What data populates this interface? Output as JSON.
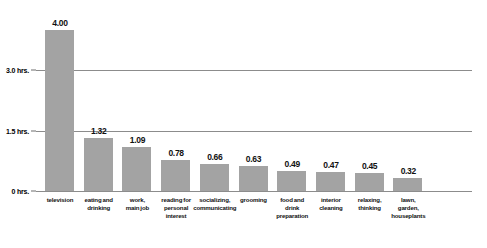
{
  "chart_data": {
    "type": "bar",
    "title": "",
    "subtitle": "",
    "xlabel": "",
    "ylabel": "",
    "ylim": [
      0,
      4.4
    ],
    "grid": true,
    "legend": null,
    "orientation": "vertical",
    "bar_color": "#a3a3a3",
    "gridline_color": "#8c8c8c",
    "value_label_format": "2dp",
    "y_ticks": [
      {
        "value": 0,
        "label": "0 hrs."
      },
      {
        "value": 1.5,
        "label": "1.5 hrs."
      },
      {
        "value": 3.0,
        "label": "3.0 hrs."
      }
    ],
    "categories": [
      "television",
      "eating and drinking",
      "work, main job",
      "reading for personal interest",
      "socializing, communicating",
      "grooming",
      "food and drink preparation",
      "interior cleaning",
      "relaxing, thinking",
      "lawn, garden, houseplants"
    ],
    "values": [
      4.0,
      1.32,
      1.09,
      0.78,
      0.66,
      0.63,
      0.49,
      0.47,
      0.45,
      0.32
    ],
    "value_labels": [
      "4.00",
      "1.32",
      "1.09",
      "0.78",
      "0.66",
      "0.63",
      "0.49",
      "0.47",
      "0.45",
      "0.32"
    ],
    "category_label_lines": [
      [
        "television"
      ],
      [
        "eating and",
        "drinking"
      ],
      [
        "work,",
        "main job"
      ],
      [
        "reading for",
        "personal",
        "interest"
      ],
      [
        "socializing,",
        "communicating"
      ],
      [
        "grooming"
      ],
      [
        "food and",
        "drink",
        "preparation"
      ],
      [
        "interior",
        "cleaning"
      ],
      [
        "relaxing,",
        "thinking"
      ],
      [
        "lawn,",
        "garden,",
        "houseplants"
      ]
    ]
  }
}
